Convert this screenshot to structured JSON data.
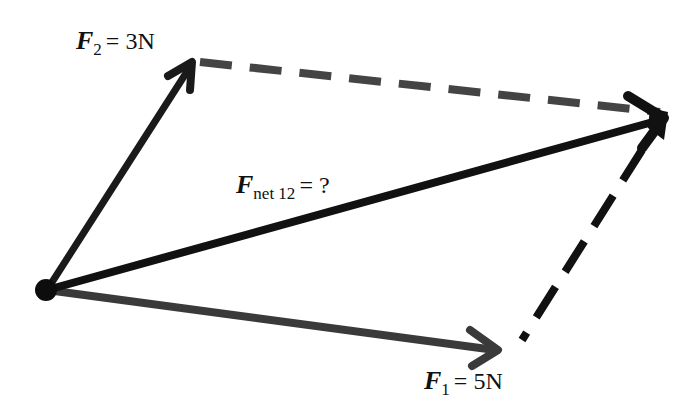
{
  "diagram": {
    "colors": {
      "background": "#ffffff",
      "vector_f2": "#1a1a1a",
      "vector_f1": "#3a3a3a",
      "vector_net": "#111111",
      "dashed": "#444444",
      "text": "#111111"
    },
    "origin": {
      "x": 47,
      "y": 290
    },
    "vectors": [
      {
        "id": "F2",
        "symbol": "F",
        "subscript": "2",
        "rest": "= 3N",
        "from": [
          47,
          290
        ],
        "to": [
          195,
          60
        ]
      },
      {
        "id": "F1",
        "symbol": "F",
        "subscript": "1",
        "rest": "= 5N",
        "from": [
          47,
          290
        ],
        "to": [
          500,
          352
        ]
      },
      {
        "id": "Fnet",
        "symbol": "F",
        "subscript": "net 12",
        "rest": "= ?",
        "from": [
          47,
          290
        ],
        "to": [
          667,
          118
        ]
      }
    ],
    "labels": {
      "f2": {
        "symbol": "F",
        "subscript": "2",
        "rest": "= 3N"
      },
      "f1": {
        "symbol": "F",
        "subscript": "1",
        "rest": "= 5N"
      },
      "fnet": {
        "symbol": "F",
        "subscript": "net 12",
        "rest": "= ?"
      }
    }
  }
}
